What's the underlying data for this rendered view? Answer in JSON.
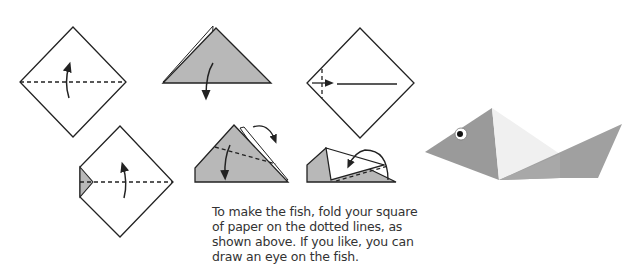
{
  "instructions": {
    "lines": [
      "To make the fish, fold your square",
      "of paper on the dotted lines, as",
      "shown above. If you like, you can",
      "draw an eye on the fish."
    ]
  },
  "colors": {
    "paper_gray": "#b8b8b8",
    "fish_gray": "#9a9a9a",
    "fish_light": "#f0f0f0",
    "line": "#222222",
    "text": "#333333"
  },
  "steps": [
    {
      "id": 1,
      "label": "fold square in half along horizontal diagonal, upward"
    },
    {
      "id": 2,
      "label": "triangle folded, fold down"
    },
    {
      "id": 3,
      "label": "fold small left corner inward"
    },
    {
      "id": 4,
      "label": "fold in half along dotted line"
    },
    {
      "id": 5,
      "label": "fold corner down and flap back"
    },
    {
      "id": 6,
      "label": "fold tail up and over"
    }
  ],
  "result": {
    "label": "finished origami fish with eye"
  }
}
